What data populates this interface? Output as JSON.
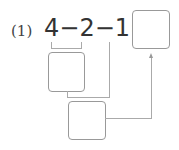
{
  "problem": {
    "number_label": "(1)",
    "expression": "4−2−1=",
    "operands": [
      "4",
      "2",
      "1"
    ],
    "operators": [
      "−",
      "−",
      "="
    ]
  },
  "boxes": [
    {
      "name": "answer-box",
      "value": ""
    },
    {
      "name": "intermediate-box-1",
      "value": ""
    },
    {
      "name": "intermediate-box-2",
      "value": ""
    }
  ]
}
